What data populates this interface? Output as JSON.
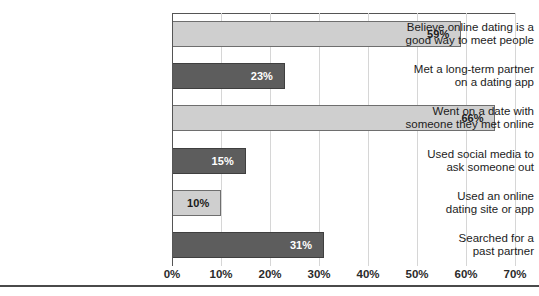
{
  "chart_data": {
    "type": "bar",
    "orientation": "horizontal",
    "title": "",
    "xlabel": "",
    "ylabel": "",
    "xlim": [
      0,
      70
    ],
    "grid": true,
    "legend": "none",
    "tick_labels": [
      "0%",
      "10%",
      "20%",
      "30%",
      "40%",
      "50%",
      "60%",
      "70%"
    ],
    "tick_values": [
      0,
      10,
      20,
      30,
      40,
      50,
      60,
      70
    ],
    "categories": [
      "Believe online dating is a good way to meet people",
      "Met a long-term partner on a dating app",
      "Went on a date with someone they met online",
      "Used social media to ask someone out",
      "Used an online dating site or app",
      "Searched for a past partner"
    ],
    "values": [
      59,
      23,
      66,
      15,
      10,
      31
    ],
    "value_labels": [
      "59%",
      "23%",
      "66%",
      "15%",
      "10%",
      "31%"
    ],
    "bars": [
      {
        "label_line1": "Believe online dating is a",
        "label_line2": "good way to meet people",
        "value": 59,
        "value_label": "59%",
        "shade": "light",
        "color": "#cfcfcf",
        "label_color": "#1a1a1a"
      },
      {
        "label_line1": "Met a long-term partner",
        "label_line2": "on a dating app",
        "value": 23,
        "value_label": "23%",
        "shade": "dark",
        "color": "#5d5d5d",
        "label_color": "#ffffff"
      },
      {
        "label_line1": "Went on a date with",
        "label_line2": "someone they met online",
        "value": 66,
        "value_label": "66%",
        "shade": "light",
        "color": "#cfcfcf",
        "label_color": "#1a1a1a"
      },
      {
        "label_line1": "Used social media to",
        "label_line2": "ask someone out",
        "value": 15,
        "value_label": "15%",
        "shade": "dark",
        "color": "#5d5d5d",
        "label_color": "#ffffff"
      },
      {
        "label_line1": "Used an online",
        "label_line2": "dating site or app",
        "value": 10,
        "value_label": "10%",
        "shade": "light",
        "color": "#cfcfcf",
        "label_color": "#1a1a1a"
      },
      {
        "label_line1": "Searched for a",
        "label_line2": "past partner",
        "value": 31,
        "value_label": "31%",
        "shade": "dark",
        "color": "#5d5d5d",
        "label_color": "#ffffff"
      }
    ]
  }
}
